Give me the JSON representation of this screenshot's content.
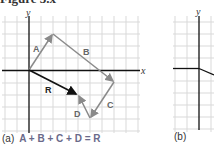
{
  "figure": {
    "title": "Figure 3.x",
    "panels": [
      {
        "id": "a",
        "caption_label": "(a)",
        "equation": "A + B + C + D = R",
        "axes": {
          "x_label": "x",
          "y_label": "y"
        },
        "vectors": [
          {
            "name": "A",
            "from": [
              0,
              0
            ],
            "to": [
              2,
              3
            ],
            "color": "#8a8a8a"
          },
          {
            "name": "B",
            "from": [
              2,
              3
            ],
            "to": [
              7,
              -1
            ],
            "color": "#8a8a8a"
          },
          {
            "name": "C",
            "from": [
              7,
              -1
            ],
            "to": [
              5,
              -4
            ],
            "color": "#8a8a8a"
          },
          {
            "name": "D",
            "from": [
              5,
              -4
            ],
            "to": [
              4,
              -2
            ],
            "color": "#8a8a8a"
          },
          {
            "name": "R",
            "from": [
              0,
              0
            ],
            "to": [
              4,
              -2
            ],
            "color": "#111111"
          }
        ]
      },
      {
        "id": "b",
        "caption_label": "(b)",
        "axes": {
          "y_label": "y"
        }
      }
    ]
  },
  "colors": {
    "grid": "#d9d9d9",
    "axis": "#111111",
    "vector": "#8a8a8a",
    "resultant": "#111111",
    "label": "#555555"
  }
}
